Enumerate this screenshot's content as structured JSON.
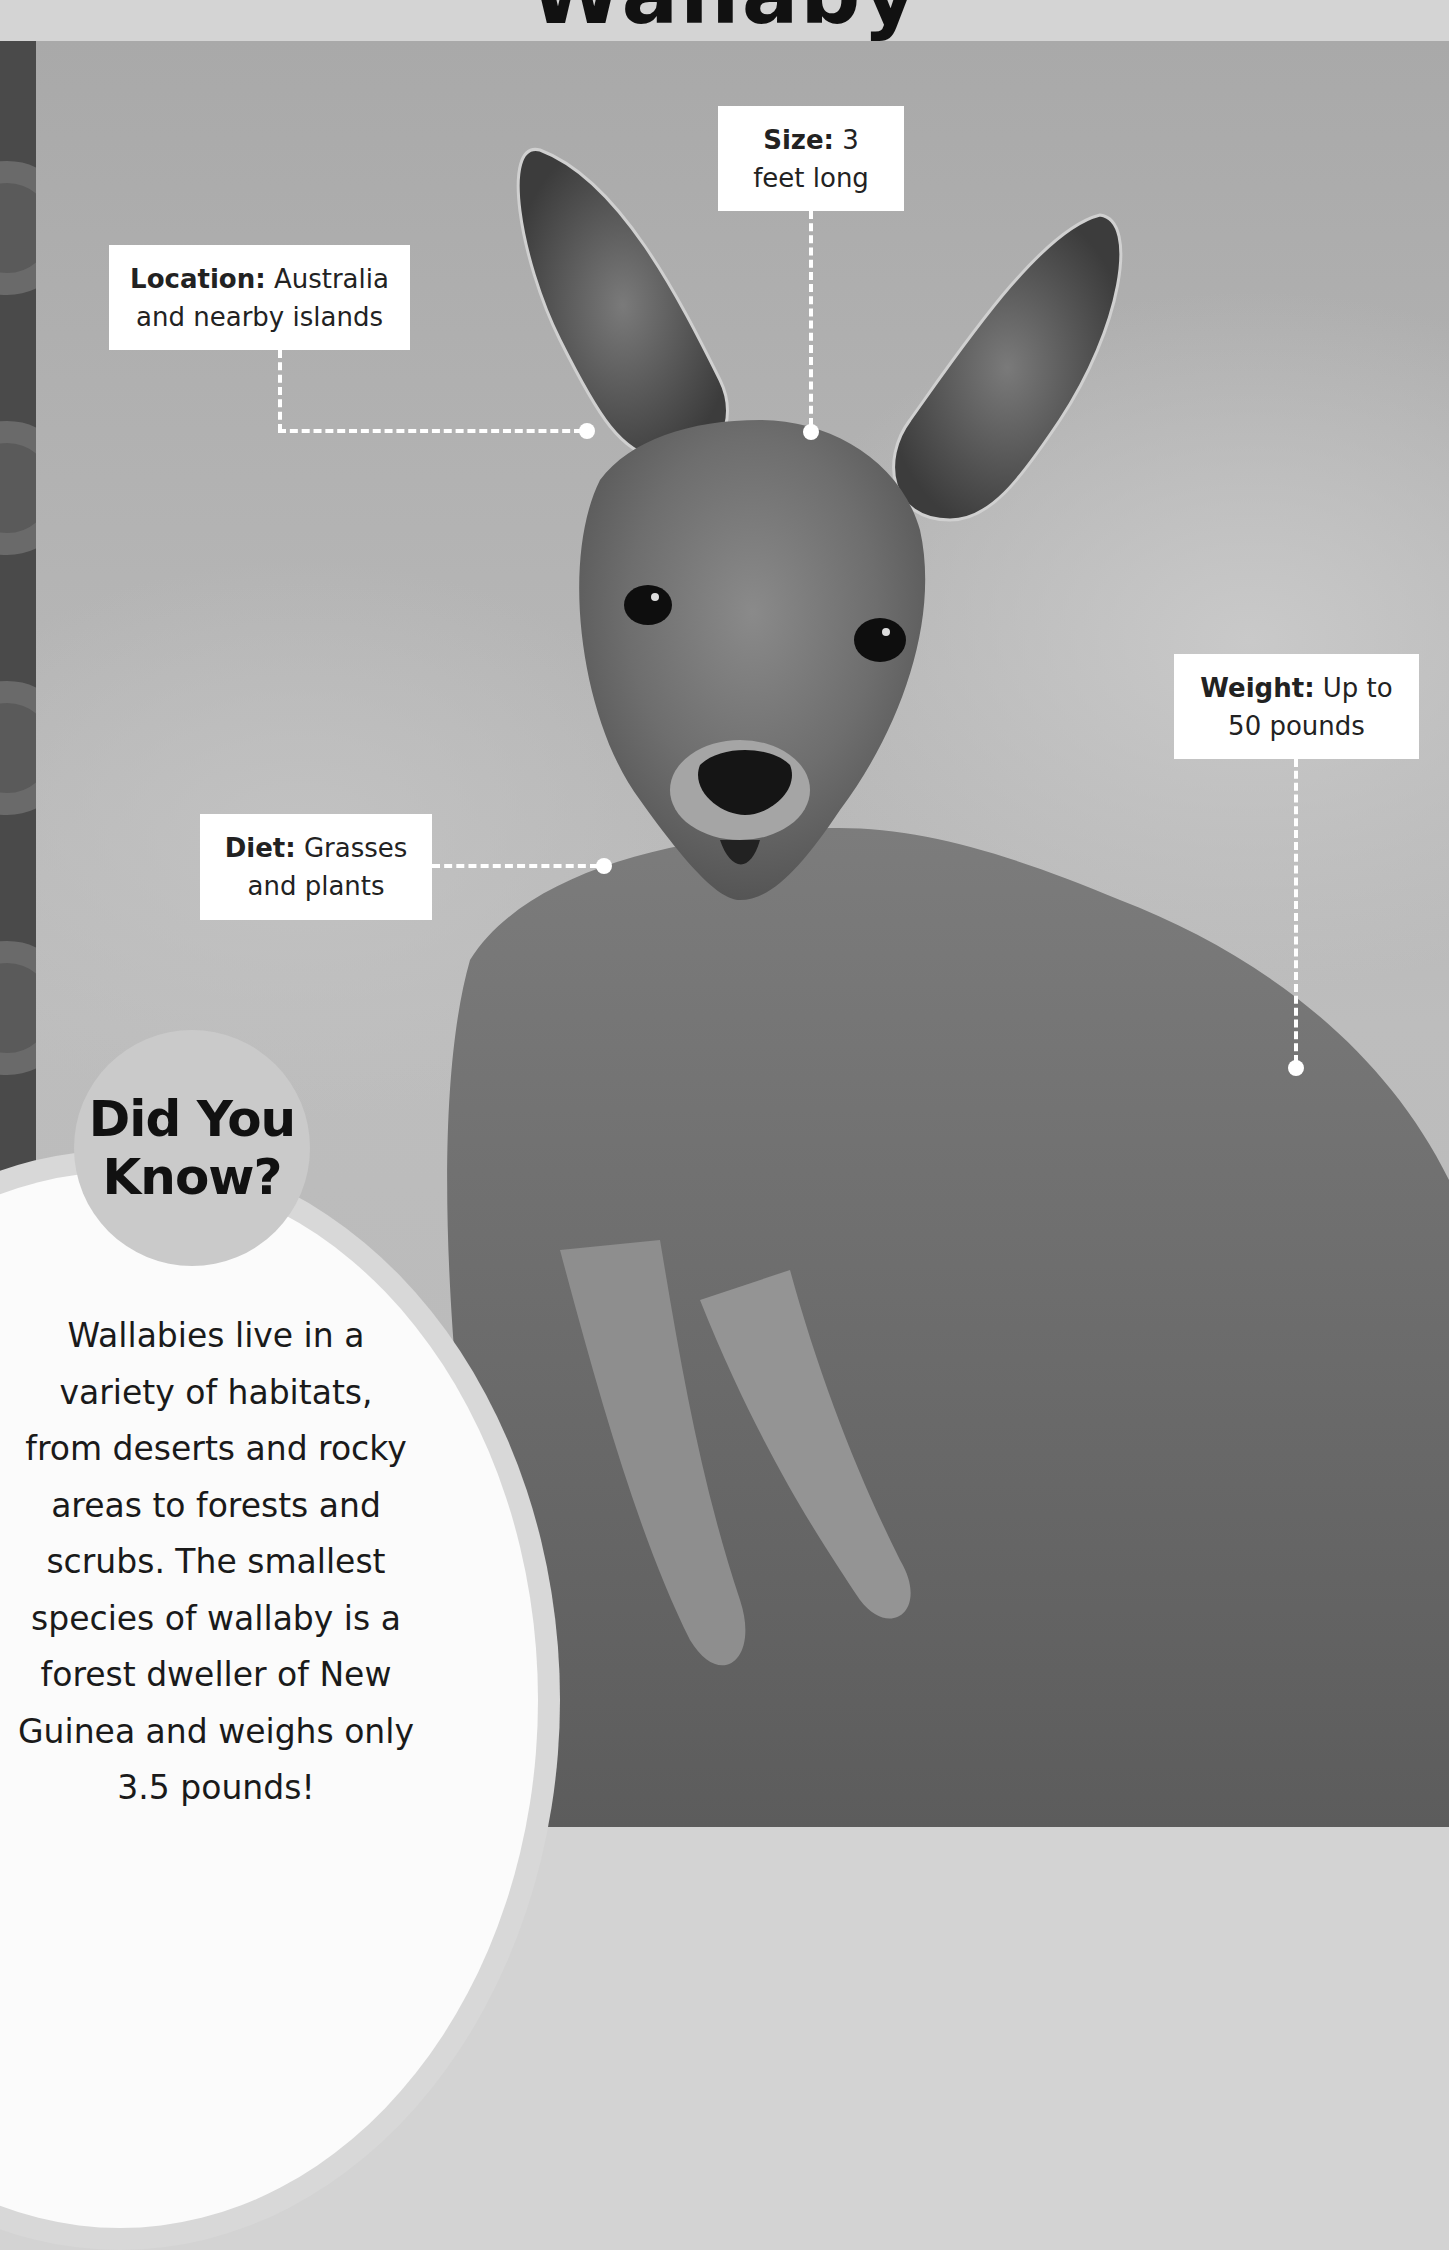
{
  "page": {
    "title": "Wallaby"
  },
  "fact_boxes": {
    "size": {
      "label": "Size:",
      "value_line1": "3",
      "value_line2": "feet long"
    },
    "location": {
      "label": "Location:",
      "value_line1": "Australia",
      "value_line2": "and nearby islands"
    },
    "diet": {
      "label": "Diet:",
      "value_line1": "Grasses",
      "value_line2": "and plants"
    },
    "weight": {
      "label": "Weight:",
      "value_line1": "Up to",
      "value_line2": "50 pounds"
    }
  },
  "did_you_know": {
    "title_line1": "Did You",
    "title_line2": "Know?",
    "lines": [
      "Wallabies live in a",
      "variety of habitats,",
      "from deserts and rocky",
      "areas to forests and",
      "scrubs. The smallest",
      "species of wallaby is a",
      "forest dweller of New",
      "Guinea and weighs only",
      "3.5 pounds!"
    ]
  },
  "colors": {
    "banner": "#d4d4d4",
    "strip": "#4a4a4a",
    "box_bg": "#ffffff",
    "dyk_circle": "#cacaca",
    "blob": "#fbfbfb",
    "blob_ring": "#d8d8d8"
  }
}
